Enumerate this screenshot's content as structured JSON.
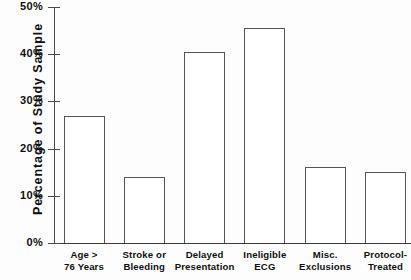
{
  "chart_data": {
    "type": "bar",
    "title": "",
    "xlabel": "",
    "ylabel": "Percentage of Study Sample",
    "ylim": [
      0,
      50
    ],
    "yunit": "%",
    "grid": false,
    "legend": "none",
    "ytick_labels": [
      "50%",
      "40%",
      "30%",
      "20%",
      "10%",
      "0%"
    ],
    "ytick_values": [
      50,
      40,
      30,
      20,
      10,
      0
    ],
    "categories": [
      "Age > 76 Years",
      "Stroke or Bleeding",
      "Delayed Presentation",
      "Ineligible ECG",
      "Misc. Exclusions",
      "Protocol-Treated"
    ],
    "category_lines": [
      [
        "Age >",
        "76 Years"
      ],
      [
        "Stroke or",
        "Bleeding"
      ],
      [
        "Delayed",
        "Presentation"
      ],
      [
        "Ineligible",
        "ECG"
      ],
      [
        "Misc.",
        "Exclusions"
      ],
      [
        "Protocol-",
        "Treated"
      ]
    ],
    "values": [
      27,
      14,
      40.5,
      45.5,
      16,
      15
    ],
    "bar_style": {
      "fill": "#ffffff",
      "edge": "#555555"
    }
  }
}
